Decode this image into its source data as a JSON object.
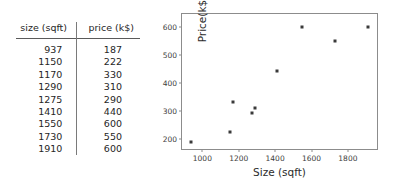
{
  "table": {
    "headers": [
      "size (sqft)",
      "price (k$)"
    ],
    "rows": [
      {
        "size": "937",
        "price": "187"
      },
      {
        "size": "1150",
        "price": "222"
      },
      {
        "size": "1170",
        "price": "330"
      },
      {
        "size": "1290",
        "price": "310"
      },
      {
        "size": "1275",
        "price": "290"
      },
      {
        "size": "1410",
        "price": "440"
      },
      {
        "size": "1550",
        "price": "600"
      },
      {
        "size": "1730",
        "price": "550"
      },
      {
        "size": "1910",
        "price": "600"
      }
    ]
  },
  "chart_data": {
    "type": "scatter",
    "title": "",
    "xlabel": "Size (sqft)",
    "ylabel": "Price(k$)",
    "x": [
      937,
      1150,
      1170,
      1290,
      1275,
      1410,
      1550,
      1730,
      1910
    ],
    "y": [
      187,
      222,
      330,
      310,
      290,
      440,
      600,
      550,
      600
    ],
    "series": [
      {
        "name": "houses",
        "points": [
          {
            "x": 937,
            "y": 187
          },
          {
            "x": 1150,
            "y": 222
          },
          {
            "x": 1170,
            "y": 330
          },
          {
            "x": 1290,
            "y": 310
          },
          {
            "x": 1275,
            "y": 290
          },
          {
            "x": 1410,
            "y": 440
          },
          {
            "x": 1550,
            "y": 600
          },
          {
            "x": 1730,
            "y": 550
          },
          {
            "x": 1910,
            "y": 600
          }
        ],
        "marker": "square",
        "color": "#3a3a3a"
      }
    ],
    "xticks": [
      1000,
      1200,
      1400,
      1600,
      1800
    ],
    "yticks": [
      200,
      300,
      400,
      500,
      600
    ],
    "xticklabels": [
      "1000",
      "1200",
      "1400",
      "1600",
      "1800"
    ],
    "yticklabels": [
      "200",
      "300",
      "400",
      "500",
      "600"
    ],
    "xlim": [
      888,
      1960
    ],
    "ylim": [
      163,
      645
    ],
    "grid": false,
    "legend": false,
    "frame_color": "#8c8c8c",
    "background": "#ffffff"
  }
}
